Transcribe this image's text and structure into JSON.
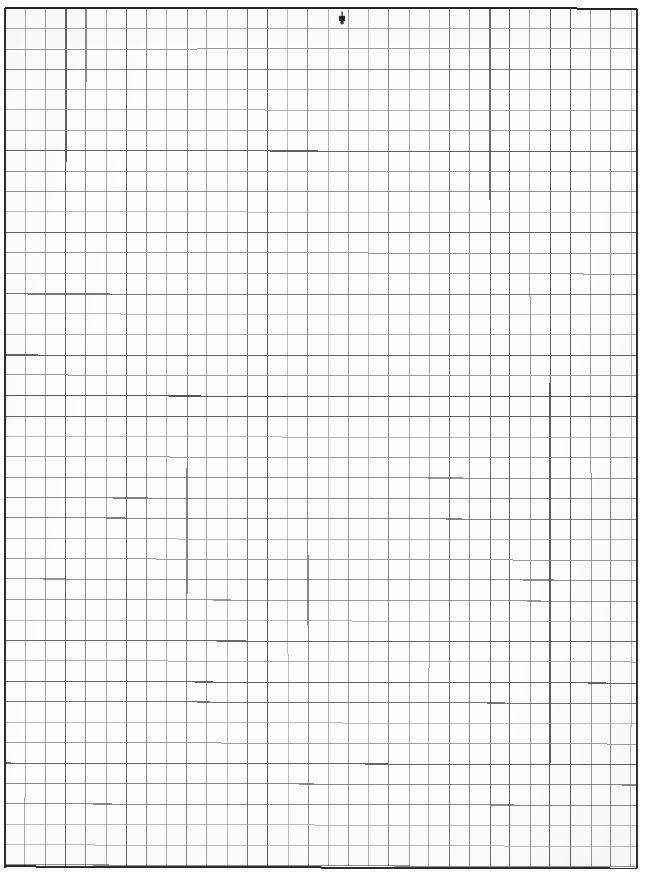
{
  "document": {
    "kind": "graph-paper-scan",
    "title": "Blank graph paper sheet",
    "description": "A scanned blank sheet of quadrille / graph paper with a ruled square grid and a dark printed border.",
    "page_width_px": 649,
    "page_height_px": 872,
    "background_color": "#fdfdfc",
    "page_color": "#ffffff"
  },
  "grid": {
    "columns": 32,
    "rows": 42,
    "cell_width_px": 20.2,
    "cell_height_px": 20.4,
    "origin_x_px": 5,
    "origin_y_px": 8,
    "right_edge_px": 637,
    "bottom_edge_px": 866,
    "line_color": "#4a4a4a",
    "line_color_light": "#8d8d8d",
    "border_color": "#1c1c1c",
    "line_width_px": 1,
    "border_width_px": 2,
    "orientation": "portrait"
  },
  "marks": [
    {
      "name": "ink-smudge",
      "type": "ink-blot",
      "x_px": 342,
      "y_px": 18,
      "width_px": 6,
      "height_px": 13,
      "color": "#1a1a1a",
      "note": "small stray pen mark near the top edge"
    }
  ],
  "labels": {
    "none_present": "This sheet contains no printed text, numbers, axis labels or legends."
  }
}
